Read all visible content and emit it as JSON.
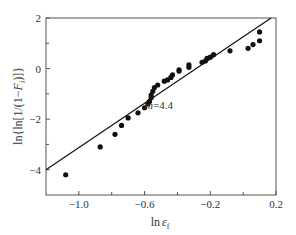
{
  "chart_data": {
    "type": "scatter",
    "title": "",
    "xlabel": "ln ε_f",
    "ylabel": "ln{ln[1/(1−F_i)]}",
    "xlim": [
      -1.2,
      0.2
    ],
    "ylim": [
      -5,
      2
    ],
    "grid": false,
    "legend": null,
    "x_ticks": [
      -1.0,
      -0.6,
      -0.2,
      0.2
    ],
    "x_minor_ticks": [
      -0.8,
      -0.4,
      0.0
    ],
    "y_ticks": [
      2,
      0,
      -2,
      -4
    ],
    "y_minor_ticks": [
      1,
      -1,
      -3
    ],
    "annotations": [
      {
        "text": "m=4.4",
        "x": -0.52,
        "y": -1.9
      }
    ],
    "fit_line": {
      "x": [
        -1.2,
        0.17
      ],
      "y": [
        -4.0,
        2.0
      ],
      "slope": 4.4
    },
    "series": [
      {
        "name": "data",
        "x": [
          -1.08,
          -0.87,
          -0.78,
          -0.74,
          -0.7,
          -0.64,
          -0.6,
          -0.58,
          -0.57,
          -0.56,
          -0.56,
          -0.55,
          -0.54,
          -0.52,
          -0.48,
          -0.46,
          -0.44,
          -0.43,
          -0.39,
          -0.39,
          -0.33,
          -0.33,
          -0.25,
          -0.23,
          -0.22,
          -0.2,
          -0.18,
          -0.08,
          0.03,
          0.06,
          0.1,
          0.1
        ],
        "y": [
          -4.2,
          -3.1,
          -2.6,
          -2.25,
          -1.95,
          -1.75,
          -1.55,
          -1.4,
          -1.3,
          -1.15,
          -1.05,
          -0.9,
          -0.75,
          -0.65,
          -0.5,
          -0.45,
          -0.35,
          -0.25,
          -0.1,
          -0.05,
          0.05,
          0.15,
          0.25,
          0.3,
          0.4,
          0.45,
          0.55,
          0.7,
          0.8,
          0.95,
          1.1,
          1.45
        ]
      }
    ]
  },
  "labels": {
    "x_ticks": [
      "−1.0",
      "−0.6",
      "−0.2",
      "0.2"
    ],
    "y_ticks": [
      "2",
      "0",
      "−2",
      "−4"
    ],
    "annotation": "m=4.4"
  }
}
